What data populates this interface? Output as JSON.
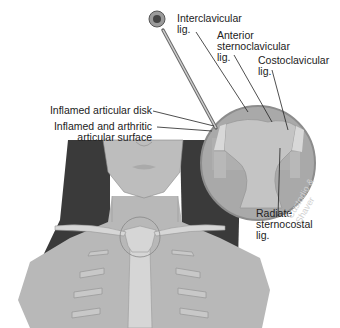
{
  "figure": {
    "labels": {
      "interclavicular": "Interclavicular\nlig.",
      "anterior_sternoclavicular": "Anterior\nsternoclavicular\nlig.",
      "costoclavicular": "Costoclavicular\nlig.",
      "inflamed_disk": "Inflamed articular disk",
      "inflamed_surface": "Inflamed and arthritic\narticular surface",
      "radiate_sternocostal": "Radiate\nsternocostal\nlig."
    },
    "watermark": "Custodio & Shaver",
    "colors": {
      "skin": "#b8b8b8",
      "hair": "#3a3a3a",
      "bone": "#d6d6d6",
      "magnifier_bg": "#a9a9a9",
      "magnifier_border": "#8c8c8c",
      "ribs": "#c4c4c4",
      "cartilage": "#e2e2e2"
    }
  }
}
